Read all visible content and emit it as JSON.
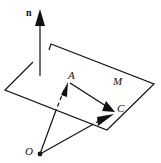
{
  "diagram": {
    "labels": {
      "normal": "n",
      "plane": "M",
      "point_a": "A",
      "point_c": "C",
      "origin": "O"
    },
    "caption": "Figure 3.?? (cut off)"
  }
}
